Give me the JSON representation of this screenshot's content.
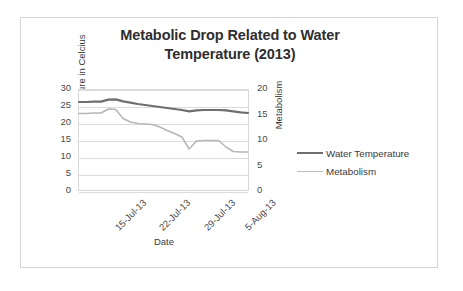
{
  "chart_data": {
    "type": "line",
    "title": "Metabolic Drop Related to Water Temperature (2013)",
    "title_lines": [
      "Metabolic Drop Related to Water",
      "Temperature (2013)"
    ],
    "xlabel": "Date",
    "ylabel": "Temperature in Celcius",
    "y2label": "Metabolism",
    "ylim": [
      0,
      30
    ],
    "y2lim": [
      0,
      20
    ],
    "yticks": [
      30,
      25,
      20,
      15,
      10,
      5,
      0
    ],
    "y2ticks": [
      20,
      15,
      10,
      5,
      0
    ],
    "grid": true,
    "legend_position": "right",
    "xtick_labels": [
      "15-Jul-13",
      "22-Jul-13",
      "29-Jul-13",
      "5-Aug-13"
    ],
    "xtick_positions_pct": [
      4,
      30,
      56,
      80
    ],
    "x": [
      0,
      1,
      2,
      3,
      4,
      5,
      6,
      7,
      8,
      9,
      10,
      11,
      12,
      13,
      14,
      15,
      16,
      17,
      18,
      19,
      20,
      21,
      22,
      23
    ],
    "series": [
      {
        "name": "Water Temperature",
        "axis": "left",
        "color": "#6e6e6e",
        "units": "Celcius",
        "values": [
          26.4,
          26.4,
          26.5,
          26.5,
          27.1,
          27.2,
          26.6,
          26.2,
          25.8,
          25.5,
          25.2,
          24.9,
          24.6,
          24.3,
          24.0,
          23.6,
          23.9,
          24.0,
          24.0,
          24.0,
          23.9,
          23.6,
          23.3,
          23.1
        ]
      },
      {
        "name": "Metabolism",
        "axis": "right",
        "color": "#b6b6b6",
        "units": "Metabolism",
        "values": [
          15.3,
          15.3,
          15.4,
          15.4,
          16.2,
          16.1,
          14.3,
          13.6,
          13.3,
          13.2,
          13.1,
          12.6,
          11.9,
          11.3,
          10.6,
          8.2,
          9.8,
          9.9,
          9.9,
          9.9,
          8.6,
          7.7,
          7.6,
          7.6
        ]
      }
    ],
    "legend": [
      {
        "label": "Water Temperature",
        "color": "#6e6e6e",
        "width": 2.4
      },
      {
        "label": "Metabolism",
        "color": "#bdbdbd",
        "width": 1.6
      }
    ]
  }
}
